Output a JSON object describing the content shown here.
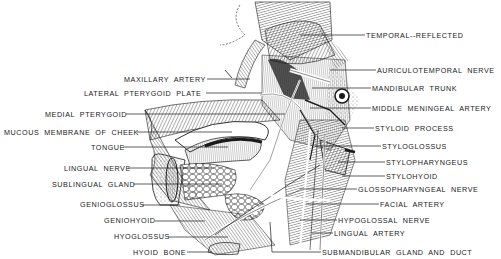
{
  "diagram": {
    "style": "black-and-white pen illustration with leader-line labels",
    "ink_color": "#1a1a1a",
    "background_color": "#ffffff"
  },
  "labels_left": [
    {
      "id": "maxillary-artery",
      "text": "MAXILLARY ARTERY",
      "x": 124,
      "y": 75,
      "line_to": [
        250,
        79
      ]
    },
    {
      "id": "lateral-pterygoid-plate",
      "text": "LATERAL PTERYGOID PLATE",
      "x": 84,
      "y": 89,
      "line_to": [
        262,
        93
      ]
    },
    {
      "id": "medial-pterygoid",
      "text": "MEDIAL PTERYGOID",
      "x": 45,
      "y": 110,
      "line_to": [
        285,
        114
      ]
    },
    {
      "id": "mucous-membrane-of-cheek",
      "text": "MUCOUS MEMBRANE OF CHEEK",
      "x": 4,
      "y": 128,
      "line_to": [
        232,
        132
      ]
    },
    {
      "id": "tongue",
      "text": "TONGUE",
      "x": 91,
      "y": 143,
      "line_to": [
        228,
        147
      ]
    },
    {
      "id": "lingual-nerve",
      "text": "LINGUAL NERVE",
      "x": 64,
      "y": 164,
      "line_to": [
        212,
        168
      ]
    },
    {
      "id": "sublingual-gland",
      "text": "SUBLINGUAL GLAND",
      "x": 52,
      "y": 180,
      "line_to": [
        222,
        184
      ]
    },
    {
      "id": "genioglossus",
      "text": "GENIOGLOSSUS",
      "x": 80,
      "y": 200,
      "line_to": [
        180,
        205
      ]
    },
    {
      "id": "geniohyoid",
      "text": "GENIOHYOID",
      "x": 104,
      "y": 216,
      "line_to": [
        205,
        221
      ]
    },
    {
      "id": "hyoglossus",
      "text": "HYOGLOSSUS",
      "x": 114,
      "y": 232,
      "line_to": [
        228,
        237
      ]
    },
    {
      "id": "hyoid-bone",
      "text": "HYOID BONE",
      "x": 133,
      "y": 248,
      "line_to": [
        212,
        252
      ]
    }
  ],
  "labels_right": [
    {
      "id": "temporal-reflected",
      "text": "TEMPORAL--REFLECTED",
      "x": 366,
      "y": 31,
      "line_from": [
        300,
        35
      ]
    },
    {
      "id": "auriculotemporal-nerve",
      "text": "AURICULOTEMPORAL NERVE",
      "x": 377,
      "y": 66,
      "line_from": [
        330,
        70
      ]
    },
    {
      "id": "mandibular-trunk",
      "text": "MANDIBULAR TRUNK",
      "x": 372,
      "y": 84,
      "line_from": [
        312,
        88
      ]
    },
    {
      "id": "middle-meningeal-artery",
      "text": "MIDDLE MENINGEAL ARTERY",
      "x": 372,
      "y": 104,
      "line_from": [
        310,
        108
      ]
    },
    {
      "id": "styloid-process",
      "text": "STYLOID PROCESS",
      "x": 375,
      "y": 124,
      "line_from": [
        342,
        128
      ]
    },
    {
      "id": "styloglossus",
      "text": "STYLOGLOSSUS",
      "x": 382,
      "y": 142,
      "line_from": [
        315,
        146
      ]
    },
    {
      "id": "stylopharyngeus",
      "text": "STYLOPHARYNGEUS",
      "x": 386,
      "y": 158,
      "line_from": [
        338,
        162
      ]
    },
    {
      "id": "stylohyoid",
      "text": "STYLOHYOID",
      "x": 386,
      "y": 172,
      "line_from": [
        342,
        176
      ]
    },
    {
      "id": "glossopharyngeal-nerve",
      "text": "GLOSSOPHARYNGEAL NERVE",
      "x": 358,
      "y": 185,
      "line_from": [
        300,
        189
      ]
    },
    {
      "id": "facial-artery",
      "text": "FACIAL ARTERY",
      "x": 380,
      "y": 200,
      "line_from": [
        306,
        204
      ]
    },
    {
      "id": "hypoglossal-nerve",
      "text": "HYPOGLOSSAL NERVE",
      "x": 338,
      "y": 216,
      "line_from": [
        300,
        220
      ]
    },
    {
      "id": "lingual-artery",
      "text": "LINGUAL ARTERY",
      "x": 334,
      "y": 229,
      "line_from": [
        312,
        233
      ]
    },
    {
      "id": "submandibular-gland-and-duct",
      "text": "SUBMANDIBULAR GLAND AND DUCT",
      "x": 322,
      "y": 248,
      "line_from": [
        270,
        222
      ]
    }
  ]
}
